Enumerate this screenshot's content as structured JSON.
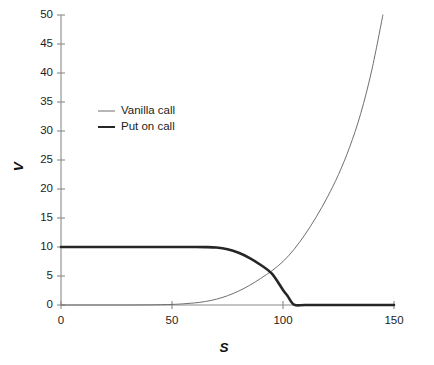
{
  "chart_data": {
    "type": "line",
    "title": "",
    "subtitle": "",
    "xlabel": "S",
    "ylabel": "V",
    "xlim": [
      0,
      150
    ],
    "ylim": [
      0,
      50
    ],
    "grid": false,
    "legend_position": "upper-left-inside",
    "xticks": [
      0,
      50,
      100,
      150
    ],
    "xtick_labels": [
      "0",
      "50",
      "100",
      "150"
    ],
    "yticks": [
      0,
      5,
      10,
      15,
      20,
      25,
      30,
      35,
      40,
      45,
      50
    ],
    "ytick_labels": [
      "0",
      "5",
      "10",
      "15",
      "20",
      "25",
      "30",
      "35",
      "40",
      "45",
      "50"
    ],
    "series": [
      {
        "name": "Vanilla call",
        "style": "thin",
        "color": "#6f6f6f",
        "linewidth": 1,
        "x": [
          0,
          10,
          20,
          30,
          40,
          50,
          55,
          60,
          65,
          70,
          75,
          80,
          85,
          90,
          95,
          100,
          105,
          110,
          115,
          120,
          125,
          130,
          135,
          140,
          145
        ],
        "values": [
          0,
          0,
          0,
          0,
          0.02,
          0.1,
          0.2,
          0.35,
          0.6,
          1.0,
          1.6,
          2.4,
          3.4,
          4.6,
          5.9,
          7.5,
          9.6,
          12.2,
          15.2,
          18.6,
          22.5,
          27.2,
          33.0,
          40.5,
          50.0
        ]
      },
      {
        "name": "Put on call",
        "style": "thick",
        "color": "#262626",
        "linewidth": 2.6,
        "x": [
          0,
          10,
          20,
          30,
          40,
          50,
          55,
          60,
          65,
          70,
          75,
          80,
          85,
          90,
          95,
          100,
          102,
          105,
          110,
          120,
          130,
          140,
          150
        ],
        "values": [
          10,
          10,
          10,
          10,
          10,
          10,
          10,
          10,
          9.98,
          9.9,
          9.6,
          9.0,
          8.1,
          6.9,
          5.4,
          2.6,
          1.6,
          0.05,
          0,
          0,
          0,
          0,
          0
        ]
      }
    ],
    "annotations": {
      "crossover_s": 97,
      "crossover_v": 6,
      "put_plateau_value": 10,
      "put_zero_at_s": 105
    }
  },
  "legend": {
    "items": [
      {
        "label": "Vanilla call"
      },
      {
        "label": "Put on call"
      }
    ]
  },
  "colors": {
    "background": "#ffffff",
    "axis": "#8a8a8a",
    "text": "#1d1d1d",
    "vanilla_call": "#6f6f6f",
    "put_on_call": "#262626"
  }
}
